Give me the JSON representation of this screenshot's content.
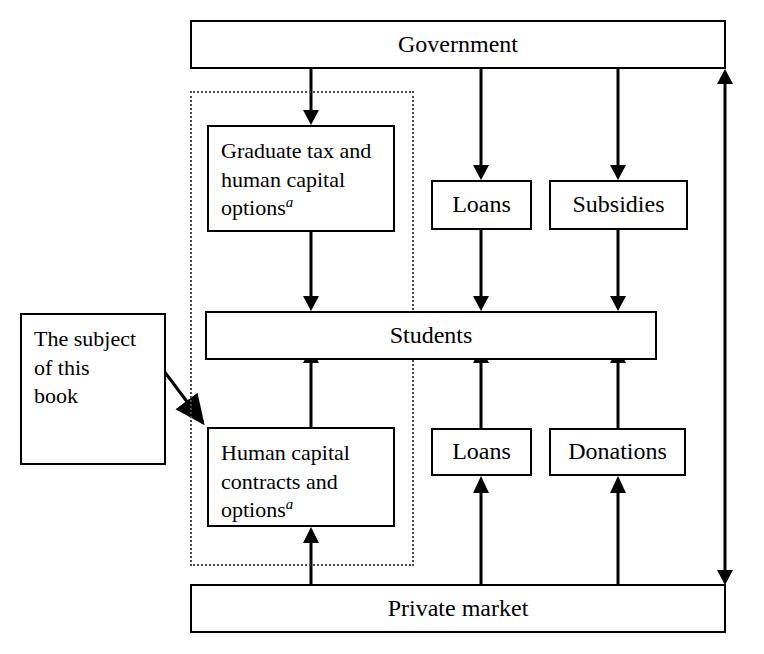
{
  "diagram": {
    "canvas": {
      "width": 764,
      "height": 654
    },
    "nodes": {
      "government": {
        "label": "Government"
      },
      "graduate_tax": {
        "line1": "Graduate tax and",
        "line2": "human capital",
        "line3": "options",
        "superscript": "a"
      },
      "loans_top": {
        "label": "Loans"
      },
      "subsidies": {
        "label": "Subsidies"
      },
      "students": {
        "label": "Students"
      },
      "annotation": {
        "line1": "The subject",
        "line2": "of this",
        "line3": "book"
      },
      "human_capital": {
        "line1": "Human capital",
        "line2": "contracts and",
        "line3": "options",
        "superscript": "a"
      },
      "loans_bottom": {
        "label": "Loans"
      },
      "donations": {
        "label": "Donations"
      },
      "private_market": {
        "label": "Private market"
      }
    },
    "group": {
      "name": "book-subject-group"
    },
    "colors": {
      "stroke": "#000000",
      "fill": "#ffffff",
      "dotted_stroke": "#4a4a4a"
    },
    "edges": [
      {
        "from": "government",
        "to": "graduate-tax",
        "arrow": "down"
      },
      {
        "from": "government",
        "to": "loans-top",
        "arrow": "down"
      },
      {
        "from": "government",
        "to": "subsidies",
        "arrow": "down"
      },
      {
        "from": "graduate-tax",
        "to": "students",
        "arrow": "down"
      },
      {
        "from": "loans-top",
        "to": "students",
        "arrow": "down"
      },
      {
        "from": "subsidies",
        "to": "students",
        "arrow": "down"
      },
      {
        "from": "human-capital",
        "to": "students",
        "arrow": "up"
      },
      {
        "from": "loans-bottom",
        "to": "students",
        "arrow": "up"
      },
      {
        "from": "donations",
        "to": "students",
        "arrow": "up"
      },
      {
        "from": "private-market",
        "to": "human-capital",
        "arrow": "up"
      },
      {
        "from": "private-market",
        "to": "loans-bottom",
        "arrow": "up"
      },
      {
        "from": "private-market",
        "to": "donations",
        "arrow": "up"
      },
      {
        "from": "private-market",
        "to": "government",
        "arrow": "both"
      },
      {
        "from": "annotation",
        "to": "human-capital",
        "arrow": "down-right"
      }
    ]
  }
}
